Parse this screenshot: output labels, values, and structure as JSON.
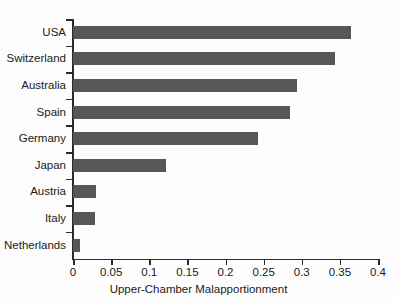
{
  "chart_data": {
    "type": "bar",
    "orientation": "horizontal",
    "title": "",
    "xlabel": "Upper-Chamber Malapportionment",
    "ylabel": "",
    "categories": [
      "USA",
      "Switzerland",
      "Australia",
      "Spain",
      "Germany",
      "Japan",
      "Austria",
      "Italy",
      "Netherlands"
    ],
    "values": [
      0.365,
      0.343,
      0.294,
      0.285,
      0.242,
      0.122,
      0.03,
      0.029,
      0.009
    ],
    "xlim": [
      0,
      0.4
    ],
    "xticks": [
      0,
      0.05,
      0.1,
      0.15,
      0.2,
      0.25,
      0.3,
      0.35,
      0.4
    ],
    "xtick_labels": [
      "0",
      "0.05",
      "0.1",
      "0.15",
      "0.2",
      "0.25",
      "0.3",
      "0.35",
      "0.4"
    ],
    "grid": false,
    "legend": null,
    "bar_color": "#575757",
    "axis_color": "#2b2b2b",
    "background": "#fdfdfd"
  },
  "artifacts": {
    "ghost_text": "ing Electoral"
  }
}
